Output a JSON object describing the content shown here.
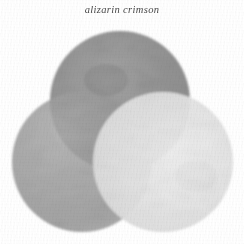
{
  "plate": {
    "title": "alizarin crimson",
    "background_color": "#ffffff",
    "width": 244,
    "height": 244
  },
  "figure": {
    "name": "three-circle-venn-wash",
    "type": "venn-diagram",
    "blend_mode": "multiply",
    "circle_count": 3,
    "circles": [
      {
        "id": "top",
        "label": "top-circle",
        "cx": 120,
        "cy": 101,
        "r": 70,
        "fill": "#8a8a8a",
        "opacity": 0.88
      },
      {
        "id": "left",
        "label": "left-circle",
        "cx": 82,
        "cy": 162,
        "r": 70,
        "fill": "#9c9c9c",
        "opacity": 0.82
      },
      {
        "id": "right",
        "label": "right-circle",
        "cx": 163,
        "cy": 162,
        "r": 70,
        "fill": "#e4e4e4",
        "opacity": 0.92
      }
    ],
    "overlap_tones": {
      "top_left": "#5a5a5a",
      "top_right": "#7d7d7d",
      "left_right": "#949494",
      "center_all_three": "#4a4a4a"
    }
  }
}
